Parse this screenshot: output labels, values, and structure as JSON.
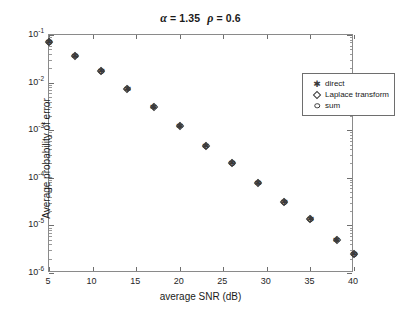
{
  "chart_data": {
    "type": "scatter",
    "title_parts": {
      "alpha_symbol": "α",
      "alpha_eq": " = 1.35",
      "rho_symbol": "ρ",
      "rho_eq": " = 0.6"
    },
    "xlabel": "average SNR (dB)",
    "ylabel": "Average probability of error",
    "xlim": [
      5,
      40
    ],
    "ylim": [
      1e-06,
      0.1
    ],
    "yscale": "log",
    "xscale": "linear",
    "grid": false,
    "legend_position": "upper right",
    "xticks": [
      5,
      10,
      15,
      20,
      25,
      30,
      35,
      40
    ],
    "xtick_labels": [
      "5",
      "10",
      "15",
      "20",
      "25",
      "30",
      "35",
      "40"
    ],
    "yticks": [
      0.1,
      0.01,
      0.001,
      0.0001,
      1e-05,
      1e-06
    ],
    "ytick_labels": [
      "10-1",
      "10-2",
      "10-3",
      "10-4",
      "10-5",
      "10-6"
    ],
    "ytick_mantissa": [
      "10",
      "10",
      "10",
      "10",
      "10",
      "10"
    ],
    "ytick_exponent": [
      "-1",
      "-2",
      "-3",
      "-4",
      "-5",
      "-6"
    ],
    "x": [
      5,
      8,
      11,
      14,
      17,
      20,
      23,
      26,
      29,
      32,
      35,
      38,
      40
    ],
    "series": [
      {
        "name": "direct",
        "marker": "star-icon",
        "values": [
          0.07,
          0.037,
          0.0175,
          0.0075,
          0.0031,
          0.00125,
          0.00046,
          0.0002,
          7.8e-05,
          3.1e-05,
          1.35e-05,
          5e-06,
          2.5e-06
        ]
      },
      {
        "name": "Laplace transform",
        "marker": "diamond-icon",
        "values": [
          0.07,
          0.037,
          0.0175,
          0.0075,
          0.0031,
          0.00125,
          0.00046,
          0.0002,
          7.8e-05,
          3.1e-05,
          1.35e-05,
          5e-06,
          2.5e-06
        ]
      },
      {
        "name": "sum",
        "marker": "circle-icon",
        "values": [
          0.07,
          0.037,
          0.0175,
          0.0075,
          0.0031,
          0.00125,
          0.00046,
          0.0002,
          7.8e-05,
          3.1e-05,
          1.35e-05,
          5e-06,
          2.5e-06
        ]
      }
    ]
  },
  "legend": {
    "entries": [
      {
        "label": "direct",
        "marker": "star-icon"
      },
      {
        "label": "Laplace transform",
        "marker": "diamond-icon"
      },
      {
        "label": "sum",
        "marker": "circle-icon"
      }
    ]
  },
  "colors": {
    "marker": "#3a3a3a",
    "axis": "#8a8a8a",
    "tick": "#6e6e6e",
    "text": "#1a1a1a",
    "background": "#ffffff"
  }
}
